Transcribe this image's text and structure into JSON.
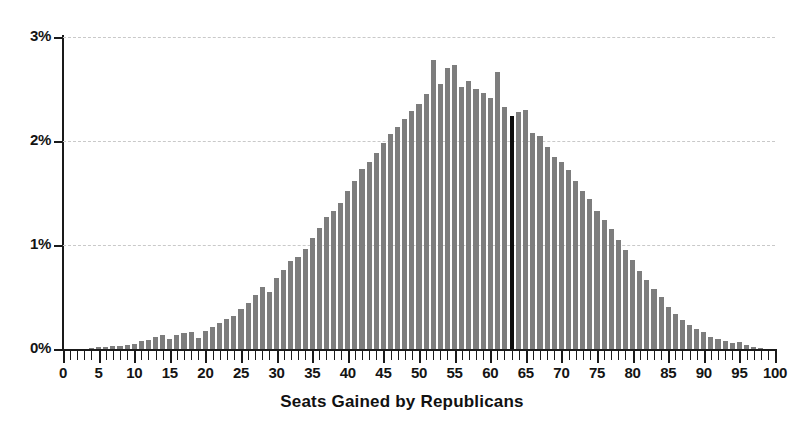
{
  "chart_data": {
    "type": "bar",
    "title": "",
    "xlabel": "Seats Gained by Republicans",
    "ylabel": "",
    "xlim": [
      0,
      100
    ],
    "ylim": [
      0,
      3
    ],
    "grid": true,
    "legend": null,
    "y_tick_labels": [
      "0%",
      "1%",
      "2%",
      "3%"
    ],
    "y_tick_values": [
      0,
      1,
      2,
      3
    ],
    "x_tick_labels": [
      "0",
      "5",
      "10",
      "15",
      "20",
      "25",
      "30",
      "35",
      "40",
      "45",
      "50",
      "55",
      "60",
      "65",
      "70",
      "75",
      "80",
      "85",
      "90",
      "95",
      "100"
    ],
    "x_tick_values": [
      0,
      5,
      10,
      15,
      20,
      25,
      30,
      35,
      40,
      45,
      50,
      55,
      60,
      65,
      70,
      75,
      80,
      85,
      90,
      95,
      100
    ],
    "x_minor_tick_step": 1,
    "bar_color": "#7d7d7d",
    "marker_color": "#0d0d0d",
    "marker_category": 63,
    "marker_label": "63",
    "annotation": "Black bar marks 63 seats gained",
    "categories": [
      0,
      1,
      2,
      3,
      4,
      5,
      6,
      7,
      8,
      9,
      10,
      11,
      12,
      13,
      14,
      15,
      16,
      17,
      18,
      19,
      20,
      21,
      22,
      23,
      24,
      25,
      26,
      27,
      28,
      29,
      30,
      31,
      32,
      33,
      34,
      35,
      36,
      37,
      38,
      39,
      40,
      41,
      42,
      43,
      44,
      45,
      46,
      47,
      48,
      49,
      50,
      51,
      52,
      53,
      54,
      55,
      56,
      57,
      58,
      59,
      60,
      61,
      62,
      63,
      64,
      65,
      66,
      67,
      68,
      69,
      70,
      71,
      72,
      73,
      74,
      75,
      76,
      77,
      78,
      79,
      80,
      81,
      82,
      83,
      84,
      85,
      86,
      87,
      88,
      89,
      90,
      91,
      92,
      93,
      94,
      95,
      96,
      97,
      98,
      99,
      100
    ],
    "values": [
      0.0,
      0.0,
      0.0,
      0.0,
      0.01,
      0.02,
      0.02,
      0.03,
      0.03,
      0.04,
      0.05,
      0.08,
      0.09,
      0.12,
      0.13,
      0.1,
      0.13,
      0.15,
      0.16,
      0.11,
      0.17,
      0.21,
      0.25,
      0.29,
      0.32,
      0.38,
      0.44,
      0.52,
      0.6,
      0.55,
      0.68,
      0.76,
      0.85,
      0.88,
      0.96,
      1.07,
      1.16,
      1.27,
      1.33,
      1.4,
      1.52,
      1.62,
      1.73,
      1.8,
      1.88,
      1.98,
      2.07,
      2.13,
      2.21,
      2.29,
      2.36,
      2.45,
      2.78,
      2.55,
      2.7,
      2.73,
      2.52,
      2.58,
      2.5,
      2.46,
      2.41,
      2.66,
      2.33,
      2.24,
      2.28,
      2.3,
      2.08,
      2.05,
      1.94,
      1.85,
      1.8,
      1.72,
      1.62,
      1.52,
      1.44,
      1.33,
      1.24,
      1.15,
      1.05,
      0.95,
      0.86,
      0.75,
      0.66,
      0.58,
      0.5,
      0.4,
      0.34,
      0.28,
      0.23,
      0.19,
      0.16,
      0.12,
      0.1,
      0.08,
      0.06,
      0.07,
      0.04,
      0.02,
      0.01,
      0.0,
      0.0
    ]
  },
  "axis": {
    "x_title": "Seats Gained by Republicans"
  }
}
